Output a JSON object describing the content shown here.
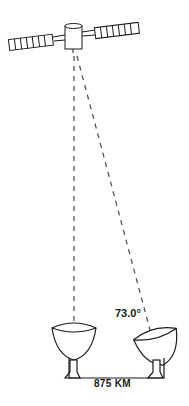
{
  "diagram": {
    "type": "satellite-ground-station-geometry",
    "elements": {
      "satellite": {
        "label": "satellite",
        "icon": "satellite-icon"
      },
      "dish_left": {
        "label": "ground antenna (left)",
        "icon": "dish-antenna-icon"
      },
      "dish_right": {
        "label": "ground antenna (right)",
        "icon": "dish-antenna-icon"
      }
    },
    "annotations": {
      "angle": "73.0°",
      "baseline_distance": "875  KM"
    },
    "colors": {
      "stroke": "#1a1a1a",
      "dashed_line": "#555555",
      "background": "#ffffff"
    }
  }
}
